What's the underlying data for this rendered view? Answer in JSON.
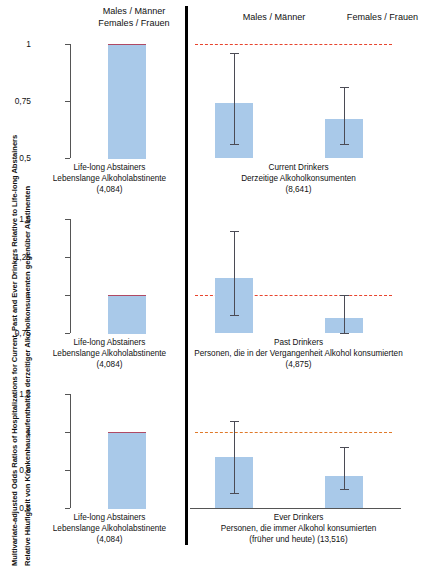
{
  "axis_titles": {
    "english": "Multivariate-adjusted Odds Ratios of Hospitalizations for Current, Past and Ever Drinkers Relative to Life-long Abstainers",
    "german": "Relative Häufigkeit von Krankenhausaufenthalten derzeitiger Alkoholkonsumenten gegenüber Abstinenten"
  },
  "headers": {
    "reference_group": "Males / Männer\nFemales / Frauen",
    "reference_line1": "Males / Männer",
    "reference_line2": "Females / Frauen",
    "males": "Males / Männer",
    "females": "Females / Frauen"
  },
  "colors": {
    "bar": "#a9c9e9",
    "error_bar": "#4b4b55",
    "reference_line_red": "#e8442e",
    "reference_line_orange": "#e07a2a",
    "axis": "#555555",
    "divider": "#000000"
  },
  "reference_label": {
    "line1": "Life-long Abstainers",
    "line2": "Lebenslange Alkoholabstinente",
    "line3": "(4,084)"
  },
  "rows": [
    {
      "id": "current-drinkers",
      "caption_line1": "Current Drinkers",
      "caption_line2": "Derzeitige Alkoholkonsumenten",
      "caption_line3": "(8,641)",
      "ylim": [
        0.5,
        1.0
      ],
      "yticks": [
        0.5,
        0.75,
        1.0
      ],
      "yticklabels": [
        "0,5",
        "0,75",
        "1"
      ],
      "refline": 1.0,
      "refline_color": "red",
      "reference_bar": 1.0,
      "males": {
        "value": 0.74,
        "ci_low": 0.56,
        "ci_high": 0.96
      },
      "females": {
        "value": 0.67,
        "ci_low": 0.56,
        "ci_high": 0.81
      }
    },
    {
      "id": "past-drinkers",
      "caption_line1": "Past Drinkers",
      "caption_line2": "Personen, die in der Vergangenheit Alkohol konsumierten",
      "caption_line3": "(4,875)",
      "ylim": [
        0.75,
        1.5
      ],
      "yticks": [
        0.75,
        1.0,
        1.25,
        1.5
      ],
      "yticklabels": [
        "0,75",
        "1",
        "1,25",
        "1,5"
      ],
      "refline": 1.0,
      "refline_color": "red",
      "reference_bar": 1.0,
      "males": {
        "value": 1.11,
        "ci_low": 0.87,
        "ci_high": 1.42
      },
      "females": {
        "value": 0.85,
        "ci_low": 0.75,
        "ci_high": 1.0
      }
    },
    {
      "id": "ever-drinkers",
      "caption_line1": "Ever Drinkers",
      "caption_line2": "Personen, die immer Alkohol konsumierten",
      "caption_line3": "(früher und heute) (13,516)",
      "ylim": [
        0.6,
        1.2
      ],
      "yticks": [
        0.6,
        0.8,
        1.0,
        1.2
      ],
      "yticklabels": [
        "0,6",
        "0,8",
        "1",
        "1,2"
      ],
      "refline": 1.0,
      "refline_color": "orange",
      "reference_bar": 1.0,
      "males": {
        "value": 0.87,
        "ci_low": 0.68,
        "ci_high": 1.06
      },
      "females": {
        "value": 0.77,
        "ci_low": 0.7,
        "ci_high": 0.92
      }
    }
  ],
  "chart_data": {
    "type": "bar",
    "title": "Multivariate-adjusted Odds Ratios of Hospitalizations for Current, Past and Ever Drinkers Relative to Life-long Abstainers",
    "subtitle": "Relative Häufigkeit von Krankenhausaufenthalten derzeitiger Alkoholkonsumenten gegenüber Abstinenten",
    "xlabel": "",
    "ylabel": "Odds Ratio",
    "grid": false,
    "legend_position": "none",
    "error_bars": "95% confidence interval",
    "panels": [
      {
        "panel": "Current Drinkers / Derzeitige Alkoholkonsumenten (8,641)",
        "ylim": [
          0.5,
          1.0
        ],
        "yticks": [
          0.5,
          0.75,
          1.0
        ],
        "reference_line": 1.0,
        "categories": [
          "Life-long Abstainers (4,084)",
          "Males / Männer",
          "Females / Frauen"
        ],
        "values": [
          1.0,
          0.74,
          0.67
        ],
        "ci_low": [
          1.0,
          0.56,
          0.56
        ],
        "ci_high": [
          1.0,
          0.96,
          0.81
        ]
      },
      {
        "panel": "Past Drinkers / Personen, die in der Vergangenheit Alkohol konsumierten (4,875)",
        "ylim": [
          0.75,
          1.5
        ],
        "yticks": [
          0.75,
          1.0,
          1.25,
          1.5
        ],
        "reference_line": 1.0,
        "categories": [
          "Life-long Abstainers (4,084)",
          "Males / Männer",
          "Females / Frauen"
        ],
        "values": [
          1.0,
          1.11,
          0.85
        ],
        "ci_low": [
          1.0,
          0.87,
          0.75
        ],
        "ci_high": [
          1.0,
          1.42,
          1.0
        ]
      },
      {
        "panel": "Ever Drinkers / Personen, die immer Alkohol konsumierten (früher und heute) (13,516)",
        "ylim": [
          0.6,
          1.2
        ],
        "yticks": [
          0.6,
          0.8,
          1.0,
          1.2
        ],
        "reference_line": 1.0,
        "categories": [
          "Life-long Abstainers (4,084)",
          "Males / Männer",
          "Females / Frauen"
        ],
        "values": [
          1.0,
          0.87,
          0.77
        ],
        "ci_low": [
          1.0,
          0.68,
          0.7
        ],
        "ci_high": [
          1.0,
          1.06,
          0.92
        ]
      }
    ]
  }
}
